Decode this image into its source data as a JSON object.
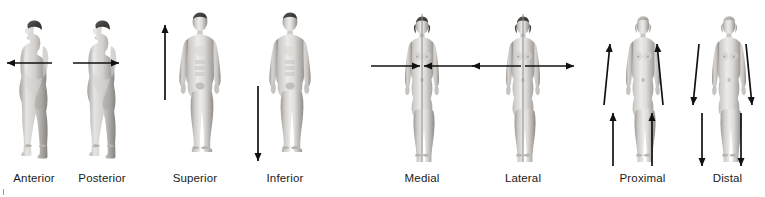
{
  "diagram": {
    "background_color": "#ffffff",
    "label_color": "#1a1a1a",
    "arrow_color": "#111111",
    "midline_color": "#8c8c8c",
    "figure_tone_light": "#e8e6e4",
    "figure_tone_mid": "#b9b6b3",
    "figure_tone_dark": "#7d7a78",
    "hair_color": "#4a4745"
  },
  "panels": [
    {
      "id": "anterior",
      "label": "Anterior",
      "view": "lateral-profile",
      "sex": "male",
      "facing": "left",
      "arrow_semantics": "single horizontal arrow pointing left toward the front of the body",
      "arrows": [
        {
          "name": "anterior-arrow",
          "direction": "left",
          "orientation": "horizontal",
          "level": "chest"
        }
      ],
      "midline": false
    },
    {
      "id": "posterior",
      "label": "Posterior",
      "view": "lateral-profile",
      "sex": "male",
      "facing": "left",
      "arrow_semantics": "single horizontal arrow pointing right toward the back of the body",
      "arrows": [
        {
          "name": "posterior-arrow",
          "direction": "right",
          "orientation": "horizontal",
          "level": "chest"
        }
      ],
      "midline": false
    },
    {
      "id": "superior",
      "label": "Superior",
      "view": "anterior-full",
      "sex": "male",
      "facing": "front",
      "arrow_semantics": "single vertical arrow pointing up toward the head",
      "arrows": [
        {
          "name": "superior-arrow",
          "direction": "up",
          "orientation": "vertical",
          "side": "left-of-figure"
        }
      ],
      "midline": false
    },
    {
      "id": "inferior",
      "label": "Inferior",
      "view": "anterior-full",
      "sex": "male",
      "facing": "front",
      "arrow_semantics": "single vertical arrow pointing down toward the feet",
      "arrows": [
        {
          "name": "inferior-arrow",
          "direction": "down",
          "orientation": "vertical",
          "side": "left-of-figure"
        }
      ],
      "midline": false
    },
    {
      "id": "medial",
      "label": "Medial",
      "view": "anterior-full",
      "sex": "female",
      "facing": "front",
      "arrow_semantics": "two horizontal arrows pointing inward toward the vertical midline",
      "arrows": [
        {
          "name": "medial-arrow-from-left",
          "direction": "right",
          "orientation": "horizontal",
          "level": "chest"
        },
        {
          "name": "medial-arrow-from-right",
          "direction": "left",
          "orientation": "horizontal",
          "level": "chest"
        }
      ],
      "midline": true
    },
    {
      "id": "lateral",
      "label": "Lateral",
      "view": "anterior-full",
      "sex": "female",
      "facing": "front",
      "arrow_semantics": "two horizontal arrows pointing outward away from the vertical midline",
      "arrows": [
        {
          "name": "lateral-arrow-to-left",
          "direction": "left",
          "orientation": "horizontal",
          "level": "chest"
        },
        {
          "name": "lateral-arrow-to-right",
          "direction": "right",
          "orientation": "horizontal",
          "level": "chest"
        }
      ],
      "midline": true
    },
    {
      "id": "proximal",
      "label": "Proximal",
      "view": "anterior-full",
      "sex": "female",
      "facing": "front",
      "arrow_semantics": "four arrows pointing up along the limbs toward the trunk",
      "arrows": [
        {
          "name": "proximal-arrow-left-arm",
          "direction": "up",
          "orientation": "slanted",
          "limb": "left-arm"
        },
        {
          "name": "proximal-arrow-right-arm",
          "direction": "up",
          "orientation": "slanted",
          "limb": "right-arm"
        },
        {
          "name": "proximal-arrow-left-leg",
          "direction": "up",
          "orientation": "vertical",
          "limb": "left-leg"
        },
        {
          "name": "proximal-arrow-right-leg",
          "direction": "up",
          "orientation": "vertical",
          "limb": "right-leg"
        }
      ],
      "midline": false
    },
    {
      "id": "distal",
      "label": "Distal",
      "view": "anterior-full",
      "sex": "female",
      "facing": "front",
      "arrow_semantics": "four arrows pointing down along the limbs away from the trunk",
      "arrows": [
        {
          "name": "distal-arrow-left-arm",
          "direction": "down",
          "orientation": "slanted",
          "limb": "left-arm"
        },
        {
          "name": "distal-arrow-right-arm",
          "direction": "down",
          "orientation": "slanted",
          "limb": "right-arm"
        },
        {
          "name": "distal-arrow-left-leg",
          "direction": "down",
          "orientation": "vertical",
          "limb": "left-leg"
        },
        {
          "name": "distal-arrow-right-leg",
          "direction": "down",
          "orientation": "vertical",
          "limb": "right-leg"
        }
      ],
      "midline": false
    }
  ]
}
